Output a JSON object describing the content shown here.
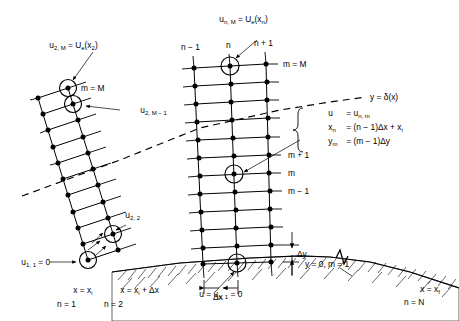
{
  "figure": {
    "ink_color": "#000000",
    "background_color": "#ffffff"
  },
  "labels": {
    "left_station_top_eq": "u",
    "left_station_top_sub": "2, M",
    "left_station_top_rest": " = U",
    "left_station_top_sub2": "e",
    "left_station_top_tail": "(x",
    "left_station_top_sub3": "2",
    "left_station_top_close": ")",
    "left_m_equals_M": "m = M",
    "left_u2M1": "u",
    "left_u2M1_sub": "2, M − 1",
    "left_u22": "u",
    "left_u22_sub": "2, 2",
    "left_u11": "u",
    "left_u11_sub": "1, 1",
    "left_u11_tail": " = 0",
    "right_station_top": "u",
    "right_station_top_sub": "n, M",
    "right_station_top_rest": " = U",
    "right_station_top_sub2": "e",
    "right_station_top_tail": "(x",
    "right_station_top_sub3": "n",
    "right_station_top_close": ")",
    "col_n_minus_1": "n − 1",
    "col_n": "n",
    "col_n_plus_1": "n + 1",
    "right_m_equals_M": "m = M",
    "row_m_plus_1": "m + 1",
    "row_m": "m",
    "row_m_minus_1": "m − 1",
    "delta_edge": "y = δ(x)",
    "wall_bc": "y = 0, m = 1",
    "delta_y": "Δy",
    "delta_x": "Δx",
    "wall_u": "u",
    "wall_u_eq": " = u",
    "wall_u_sub": "n, 1",
    "wall_u_tail": " = 0",
    "x_initial": "x = x",
    "x_initial_sub": "i",
    "n_initial": "n = 1",
    "x_second": "x = x",
    "x_second_sub": "i",
    "x_second_tail": " + Δx",
    "n_second": "n = 2",
    "x_final": "x = x",
    "x_final_sub": "f",
    "n_final": "n = N"
  },
  "definition_box": {
    "line1_lhs": "u",
    "line1_rhs": "= u",
    "line1_rhs_sub": "n, m",
    "line2_lhs": "x",
    "line2_lhs_sub": "n",
    "line2_rhs": "= (n − 1)Δx + x",
    "line2_rhs_sub": "i",
    "line3_lhs": "y",
    "line3_lhs_sub": "m",
    "line3_rhs": "= (m − 1)Δy"
  },
  "grids": {
    "left_station": {
      "description": "Tilted two-column ladder of grid points at the initial station",
      "columns": 2,
      "rows": 11
    },
    "right_station": {
      "description": "Three-column skewed grid column at an interior station n",
      "columns": 3,
      "rows": 11
    }
  }
}
